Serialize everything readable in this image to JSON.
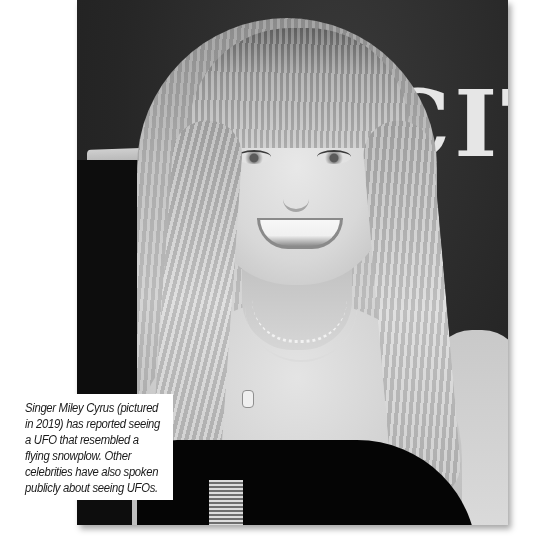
{
  "photo": {
    "subject": "Singer Miley Cyrus portrait, black and white",
    "backdrop_text": "CIT",
    "color_mode": "grayscale"
  },
  "caption": {
    "lines": [
      "Singer Miley Cyrus (pictured",
      "in 2019) has reported seeing",
      "a UFO that resembled a",
      "flying snowplow. Other",
      "celebrities have also spoken",
      "publicly about seeing UFOs."
    ],
    "text": "Singer Miley Cyrus (pictured in 2019) has reported seeing a UFO that resembled a flying snowplow. Other celebrities have also spoken publicly about seeing UFOs."
  },
  "colors": {
    "page_background": "#ffffff",
    "caption_text": "#1a1a1a",
    "backdrop": "#262626"
  }
}
